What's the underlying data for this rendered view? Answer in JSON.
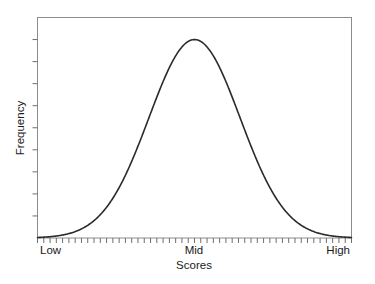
{
  "chart_data": {
    "type": "line",
    "title": "",
    "subtitle": "",
    "xlabel": "Scores",
    "ylabel": "Frequency",
    "grid": false,
    "legend": false,
    "legend_position": "none",
    "xlim": [
      0,
      100
    ],
    "ylim": [
      0,
      1
    ],
    "x_tick_labels": [
      "Low",
      "Mid",
      "High"
    ],
    "x_tick_label_positions": [
      0,
      50,
      100
    ],
    "x_minor_tick_count": 50,
    "y_tick_labels": [],
    "y_minor_tick_count": 9,
    "annotations": [],
    "curve_description": "Symmetric bell-shaped normal distribution centred at Mid",
    "series": [
      {
        "name": "Frequency distribution",
        "curve": "gaussian",
        "mean": 50,
        "std_dev": 14.5,
        "peak_value": 0.9,
        "color": "#2b2b2b",
        "line_width": 1.6,
        "x": [
          0,
          2,
          4,
          6,
          8,
          10,
          12,
          14,
          16,
          18,
          20,
          22,
          24,
          26,
          28,
          30,
          32,
          34,
          36,
          38,
          40,
          42,
          44,
          46,
          48,
          50,
          52,
          54,
          56,
          58,
          60,
          62,
          64,
          66,
          68,
          70,
          72,
          74,
          76,
          78,
          80,
          82,
          84,
          86,
          88,
          90,
          92,
          94,
          96,
          98,
          100
        ],
        "values": [
          0.018,
          0.024,
          0.031,
          0.04,
          0.051,
          0.065,
          0.082,
          0.102,
          0.127,
          0.156,
          0.19,
          0.229,
          0.274,
          0.325,
          0.381,
          0.442,
          0.506,
          0.572,
          0.638,
          0.702,
          0.761,
          0.813,
          0.856,
          0.888,
          0.909,
          0.9,
          0.909,
          0.888,
          0.856,
          0.813,
          0.761,
          0.702,
          0.638,
          0.572,
          0.506,
          0.442,
          0.381,
          0.325,
          0.274,
          0.229,
          0.19,
          0.156,
          0.127,
          0.102,
          0.082,
          0.065,
          0.051,
          0.04,
          0.031,
          0.024,
          0.018
        ]
      }
    ]
  },
  "axes": {
    "x_label": "Scores",
    "y_label": "Frequency",
    "x_tick_low": "Low",
    "x_tick_mid": "Mid",
    "x_tick_high": "High"
  },
  "style": {
    "background_color": "#ffffff",
    "frame_color": "#8c8c8c",
    "curve_color": "#2b2b2b",
    "tick_color": "#6e6e6e",
    "text_color": "#1a1a1a"
  }
}
